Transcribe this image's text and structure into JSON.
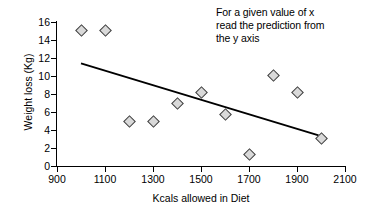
{
  "chart_data": {
    "type": "scatter",
    "title": "",
    "xlabel": "Kcals allowed in Diet",
    "ylabel": "Weight loss (Kg)",
    "xlim": [
      900,
      2100
    ],
    "ylim": [
      0,
      16
    ],
    "xticks": [
      900,
      1100,
      1300,
      1500,
      1700,
      1900,
      2100
    ],
    "yticks": [
      0,
      2,
      4,
      6,
      8,
      10,
      12,
      14,
      16
    ],
    "grid": false,
    "legend": false,
    "x": [
      1000,
      1100,
      1200,
      1300,
      1400,
      1500,
      1600,
      1700,
      1800,
      1900,
      2000
    ],
    "y": [
      15.1,
      15.1,
      5.0,
      5.0,
      7.0,
      8.2,
      5.7,
      1.3,
      10.1,
      8.2,
      3.1
    ],
    "points": [
      {
        "x": 1000,
        "y": 15.1
      },
      {
        "x": 1100,
        "y": 15.1
      },
      {
        "x": 1200,
        "y": 5.0
      },
      {
        "x": 1300,
        "y": 5.0
      },
      {
        "x": 1400,
        "y": 7.0
      },
      {
        "x": 1500,
        "y": 8.2
      },
      {
        "x": 1600,
        "y": 5.7
      },
      {
        "x": 1700,
        "y": 1.3
      },
      {
        "x": 1800,
        "y": 10.1
      },
      {
        "x": 1900,
        "y": 8.2
      },
      {
        "x": 2000,
        "y": 3.1
      }
    ],
    "series": [
      {
        "name": "Observations",
        "type": "scatter",
        "marker": "diamond",
        "marker_fill": "#d9d9d9",
        "marker_edge": "#404040",
        "values": [
          15.1,
          15.1,
          5.0,
          5.0,
          7.0,
          8.2,
          5.7,
          1.3,
          10.1,
          8.2,
          3.1
        ]
      },
      {
        "name": "Regression line",
        "type": "line",
        "color": "#000000",
        "x_start": 1000,
        "y_start": 11.4,
        "x_end": 1990,
        "y_end": 3.4
      }
    ],
    "annotations": [
      {
        "name": "prediction-note",
        "lines": [
          "For a given value of x",
          "read the prediction from",
          "the y axis"
        ]
      }
    ]
  },
  "annotation": {
    "line1": "For a given value of x",
    "line2": "read the prediction from",
    "line3": "the y axis"
  },
  "axes": {
    "y_title": "Weight loss (Kg)",
    "x_title": "Kcals allowed in Diet",
    "y_labels": [
      "16",
      "14",
      "12",
      "10",
      "8",
      "6",
      "4",
      "2",
      "0"
    ],
    "x_labels": [
      "900",
      "1100",
      "1300",
      "1500",
      "1700",
      "1900",
      "2100"
    ]
  },
  "colors": {
    "axis": "#000000",
    "marker_fill": "#d9d9d9",
    "marker_edge": "#404040",
    "trendline": "#000000",
    "background": "#ffffff"
  }
}
